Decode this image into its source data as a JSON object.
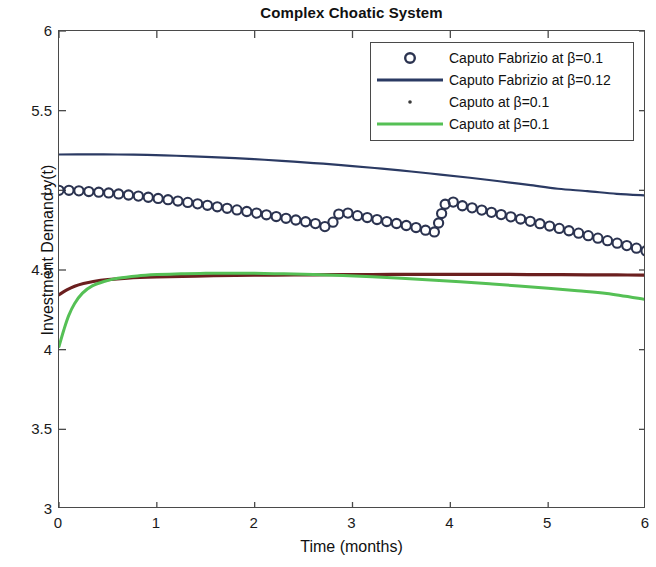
{
  "chart_data": {
    "type": "line",
    "title": "Complex Choatic System",
    "xlabel": "Time (months)",
    "ylabel": "Investment Demand y(t)",
    "xlim": [
      0,
      6
    ],
    "ylim": [
      3,
      6
    ],
    "xticks": [
      "0",
      "1",
      "2",
      "3",
      "4",
      "5",
      "6"
    ],
    "yticks": [
      "3",
      "3.5",
      "4",
      "4.5",
      "5",
      "5.5",
      "6"
    ],
    "grid": false,
    "legend_position": "upper right",
    "series": [
      {
        "name": "Caputo Fabrizio at β=0.1",
        "marker": "o",
        "style": "markers",
        "color": "#2b3350",
        "x": [
          0,
          0.12,
          0.24,
          0.36,
          0.48,
          0.6,
          0.72,
          0.84,
          0.96,
          1.08,
          1.2,
          1.32,
          1.44,
          1.56,
          1.68,
          1.8,
          1.92,
          2.04,
          2.16,
          2.28,
          2.4,
          2.52,
          2.64,
          2.76,
          2.88,
          3.0,
          3.12,
          3.24,
          3.36,
          3.48,
          3.6,
          3.72,
          3.84,
          3.96,
          4.08,
          4.2,
          4.32,
          4.44,
          4.56,
          4.68,
          4.8,
          4.92,
          5.04,
          5.16,
          5.28,
          5.4,
          5.52,
          5.64,
          5.76,
          5.88,
          6.0
        ],
        "y": [
          5.0,
          5.0,
          4.995,
          4.99,
          4.985,
          4.978,
          4.97,
          4.962,
          4.953,
          4.944,
          4.934,
          4.924,
          4.913,
          4.902,
          4.891,
          4.879,
          4.867,
          4.855,
          4.842,
          4.829,
          4.816,
          4.803,
          4.789,
          4.775,
          4.861,
          4.847,
          4.833,
          4.818,
          4.803,
          4.788,
          4.773,
          4.757,
          4.741,
          4.925,
          4.909,
          4.893,
          4.876,
          4.859,
          4.842,
          4.825,
          4.808,
          4.79,
          4.772,
          4.754,
          4.736,
          4.717,
          4.698,
          4.679,
          4.66,
          4.641,
          4.62
        ]
      },
      {
        "name": "Caputo Fabrizio at β=0.12",
        "marker": "none",
        "style": "line",
        "color": "#2b3a63",
        "x": [
          0,
          0.3,
          0.6,
          0.9,
          1.2,
          1.5,
          1.8,
          2.1,
          2.4,
          2.7,
          3.0,
          3.3,
          3.6,
          3.9,
          4.2,
          4.5,
          4.8,
          5.1,
          5.4,
          5.7,
          6.0
        ],
        "y": [
          5.225,
          5.226,
          5.225,
          5.222,
          5.217,
          5.21,
          5.202,
          5.192,
          5.18,
          5.167,
          5.152,
          5.136,
          5.118,
          5.099,
          5.079,
          5.057,
          5.034,
          5.01,
          4.995,
          4.978,
          4.968
        ]
      },
      {
        "name": "Caputo at β=0.1",
        "marker": ".",
        "style": "dots",
        "color": "#6b1f1f",
        "x": [
          0,
          0.08,
          0.16,
          0.25,
          0.35,
          0.5,
          0.7,
          1.0,
          1.4,
          1.8,
          2.2,
          2.6,
          3.0,
          3.4,
          3.8,
          4.2,
          4.6,
          5.0,
          5.4,
          5.7,
          6.0
        ],
        "y": [
          4.345,
          4.375,
          4.398,
          4.415,
          4.428,
          4.44,
          4.449,
          4.456,
          4.462,
          4.466,
          4.468,
          4.47,
          4.471,
          4.472,
          4.472,
          4.472,
          4.472,
          4.471,
          4.47,
          4.469,
          4.468
        ]
      },
      {
        "name": "Caputo at β=0.1",
        "marker": "none",
        "style": "line",
        "color": "#55c055",
        "x": [
          0,
          0.05,
          0.1,
          0.16,
          0.24,
          0.34,
          0.46,
          0.6,
          0.8,
          1.0,
          1.25,
          1.5,
          1.75,
          2.0,
          2.3,
          2.6,
          2.9,
          3.2,
          3.5,
          3.8,
          4.1,
          4.4,
          4.7,
          5.0,
          5.3,
          5.6,
          6.0
        ],
        "y": [
          4.02,
          4.125,
          4.215,
          4.29,
          4.355,
          4.4,
          4.428,
          4.448,
          4.463,
          4.471,
          4.477,
          4.479,
          4.48,
          4.479,
          4.476,
          4.471,
          4.465,
          4.457,
          4.448,
          4.438,
          4.426,
          4.413,
          4.4,
          4.386,
          4.37,
          4.353,
          4.315
        ]
      }
    ]
  },
  "legend": {
    "entries": [
      {
        "label": "Caputo Fabrizio at β=0.1",
        "sample": "circle-marker",
        "color": "#2b3350"
      },
      {
        "label": "Caputo Fabrizio at β=0.12",
        "sample": "solid-line",
        "color": "#2b3a63"
      },
      {
        "label": "Caputo at β=0.1",
        "sample": "dot-marker",
        "color": "#3a3a3a"
      },
      {
        "label": "Caputo at β=0.1",
        "sample": "solid-line",
        "color": "#55c055"
      }
    ]
  },
  "colors": {
    "axis": "#4a4a4a",
    "text": "#111111",
    "background": "#ffffff",
    "series_navy_markers": "#2b3350",
    "series_navy_line": "#2b3a63",
    "series_maroon": "#6b1f1f",
    "series_green": "#55c055"
  }
}
